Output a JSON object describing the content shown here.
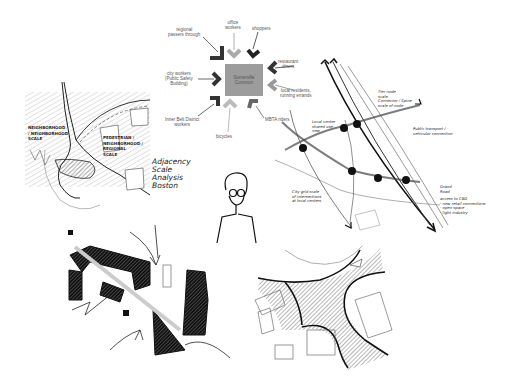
{
  "flow_diagram": {
    "center": {
      "line1": "Somerville",
      "line2": "Common"
    },
    "sources": [
      {
        "id": "regional",
        "line1": "regional",
        "line2": "passers through",
        "tone": "dark"
      },
      {
        "id": "office",
        "line1": "office",
        "line2": "workers",
        "tone": "light"
      },
      {
        "id": "shoppers",
        "line1": "shoppers",
        "line2": "",
        "tone": "dark"
      },
      {
        "id": "restaurant",
        "line1": "restaurant",
        "line2": "diners",
        "tone": "dark"
      },
      {
        "id": "local",
        "line1": "local residents,",
        "line2": "running errands",
        "tone": "light"
      },
      {
        "id": "mbta",
        "line1": "MBTA riders",
        "line2": "",
        "tone": "mid"
      },
      {
        "id": "bicycles",
        "line1": "bicycles",
        "line2": "",
        "tone": "light"
      },
      {
        "id": "innerbelt",
        "line1": "Inner Belt District",
        "line2": "workers",
        "tone": "dark"
      },
      {
        "id": "city",
        "line1": "city workers",
        "line2": "(Public Safety",
        "line3": "Building)",
        "tone": "dark"
      }
    ]
  },
  "left_sketch": {
    "label_a": [
      "NEIGHBORHOOD",
      "/ NEIGHBORHOOD",
      "SCALE"
    ],
    "label_b": [
      "PEDESTRIAN /",
      "NEIGHBORHOOD /",
      "REGIONAL",
      "SCALE"
    ],
    "label_c": [
      "Adjacency",
      "Scale",
      "Analysis",
      "Boston"
    ]
  },
  "right_sketch": {
    "label_nodes": [
      "Local center",
      "shared use",
      "new"
    ],
    "label_top": [
      "Tier node",
      "scale",
      "Connector / Spine",
      "scale of node"
    ],
    "label_transit": [
      "Public transport /",
      "vehicular connection"
    ],
    "label_bottom": [
      "City grid scale",
      "of intersections",
      "at local centers"
    ],
    "label_right": [
      "Grand",
      "Road"
    ],
    "label_access": [
      "access to CBD",
      "- new retail connections",
      "- open space",
      "- light industry"
    ]
  },
  "colors": {
    "ink": "#1a1a1a",
    "center_box": "#9c9c9c",
    "arrow_dark": "#3a3a3a",
    "arrow_light": "#b0b0b0",
    "label_grey": "#555555"
  }
}
